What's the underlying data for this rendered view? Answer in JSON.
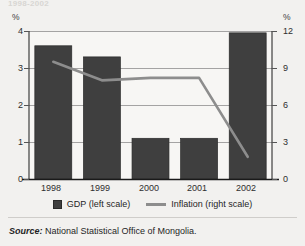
{
  "figure": {
    "title_partial": "1998-2002",
    "unit_left": "%",
    "unit_right": "%",
    "source_word": "Source:",
    "source_text": " National Statistical Office of Mongolia.",
    "colors": {
      "bar": "#3f3f3f",
      "line": "#8d8d8d",
      "panel": "#f7f6f4",
      "background": "#f2f1ef",
      "grid": "#9a9a9a",
      "axis": "#1a1a1a",
      "text": "#1f1f1f"
    }
  },
  "legend": {
    "items": [
      {
        "label": "GDP (left scale)",
        "marker": "bar-swatch-icon"
      },
      {
        "label": "Inflation (right scale)",
        "marker": "line-swatch-icon"
      }
    ]
  },
  "chart_data": {
    "type": "bar",
    "title": "1998-2002",
    "xlabel": "",
    "ylabel": "%",
    "categories": [
      "1998",
      "1999",
      "2000",
      "2001",
      "2002"
    ],
    "grid": true,
    "legend_position": "bottom",
    "axes": {
      "left": {
        "label": "%",
        "ticks": [
          "0",
          "1",
          "2",
          "3",
          "4"
        ],
        "tick_values": [
          0,
          1,
          2,
          3,
          4
        ],
        "ylim": [
          0,
          4
        ]
      },
      "right": {
        "label": "%",
        "ticks": [
          "0",
          "3",
          "6",
          "9",
          "12"
        ],
        "tick_values": [
          0,
          3,
          6,
          9,
          12
        ],
        "ylim": [
          0,
          12
        ]
      }
    },
    "series": [
      {
        "name": "GDP (left scale)",
        "type": "bar",
        "axis": "left",
        "color": "#3f3f3f",
        "values": [
          3.6,
          3.3,
          1.1,
          1.1,
          3.95
        ]
      },
      {
        "name": "Inflation (right scale)",
        "type": "line",
        "axis": "right",
        "color": "#8d8d8d",
        "values": [
          9.5,
          8.0,
          8.2,
          8.2,
          1.8
        ]
      }
    ]
  }
}
